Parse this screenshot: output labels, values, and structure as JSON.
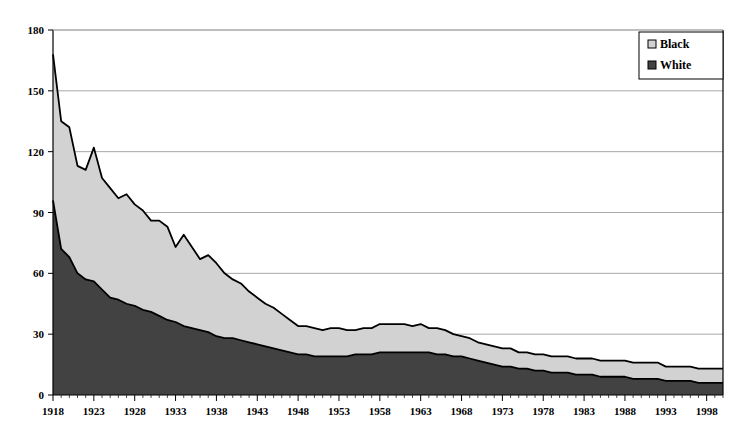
{
  "chart_data": {
    "type": "area",
    "stacked": true,
    "title": "",
    "subtitle": "",
    "xlabel": "",
    "ylabel": "",
    "xlim": [
      1918,
      2000
    ],
    "ylim": [
      0,
      180
    ],
    "yticks": [
      0,
      30,
      60,
      90,
      120,
      150,
      180
    ],
    "xticks": [
      1918,
      1923,
      1928,
      1933,
      1938,
      1943,
      1948,
      1953,
      1958,
      1963,
      1968,
      1973,
      1978,
      1983,
      1988,
      1993,
      1998
    ],
    "grid": "horizontal",
    "legend_position": "top-right",
    "legend": [
      "Black",
      "White"
    ],
    "colors": {
      "black_series": "#d2d2d2",
      "white_series": "#424242",
      "outline": "#000000",
      "grid": "#a8a8a8",
      "axis": "#000000",
      "background": "#ffffff"
    },
    "x": [
      1918,
      1919,
      1920,
      1921,
      1922,
      1923,
      1924,
      1925,
      1926,
      1927,
      1928,
      1929,
      1930,
      1931,
      1932,
      1933,
      1934,
      1935,
      1936,
      1937,
      1938,
      1939,
      1940,
      1941,
      1942,
      1943,
      1944,
      1945,
      1946,
      1947,
      1948,
      1949,
      1950,
      1951,
      1952,
      1953,
      1954,
      1955,
      1956,
      1957,
      1958,
      1959,
      1960,
      1961,
      1962,
      1963,
      1964,
      1965,
      1966,
      1967,
      1968,
      1969,
      1970,
      1971,
      1972,
      1973,
      1974,
      1975,
      1976,
      1977,
      1978,
      1979,
      1980,
      1981,
      1982,
      1983,
      1984,
      1985,
      1986,
      1987,
      1988,
      1989,
      1990,
      1991,
      1992,
      1993,
      1994,
      1995,
      1996,
      1997,
      1998,
      1999,
      2000
    ],
    "series": [
      {
        "name": "White",
        "values": [
          96,
          72,
          68,
          60,
          57,
          56,
          52,
          48,
          47,
          45,
          44,
          42,
          41,
          39,
          37,
          36,
          34,
          33,
          32,
          31,
          29,
          28,
          28,
          27,
          26,
          25,
          24,
          23,
          22,
          21,
          20,
          20,
          19,
          19,
          19,
          19,
          19,
          20,
          20,
          20,
          21,
          21,
          21,
          21,
          21,
          21,
          21,
          20,
          20,
          19,
          19,
          18,
          17,
          16,
          15,
          14,
          14,
          13,
          13,
          12,
          12,
          11,
          11,
          11,
          10,
          10,
          10,
          9,
          9,
          9,
          9,
          8,
          8,
          8,
          8,
          7,
          7,
          7,
          7,
          6,
          6,
          6,
          6
        ]
      },
      {
        "name": "Black",
        "values": [
          72,
          63,
          64,
          53,
          54,
          66,
          55,
          54,
          50,
          54,
          50,
          49,
          45,
          47,
          46,
          37,
          45,
          40,
          35,
          38,
          36,
          32,
          29,
          28,
          25,
          23,
          21,
          20,
          18,
          16,
          14,
          14,
          14,
          13,
          14,
          14,
          13,
          12,
          13,
          13,
          14,
          14,
          14,
          14,
          13,
          14,
          12,
          13,
          12,
          11,
          10,
          10,
          9,
          9,
          9,
          9,
          9,
          8,
          8,
          8,
          8,
          8,
          8,
          8,
          8,
          8,
          8,
          8,
          8,
          8,
          8,
          8,
          8,
          8,
          8,
          7,
          7,
          7,
          7,
          7,
          7,
          7,
          7
        ]
      }
    ],
    "totals": [
      168,
      135,
      132,
      113,
      111,
      122,
      107,
      102,
      97,
      99,
      94,
      91,
      86,
      86,
      83,
      73,
      79,
      73,
      67,
      69,
      65,
      60,
      57,
      55,
      51,
      48,
      45,
      43,
      40,
      37,
      34,
      34,
      33,
      32,
      33,
      33,
      32,
      32,
      33,
      33,
      35,
      35,
      35,
      35,
      34,
      35,
      33,
      33,
      32,
      30,
      29,
      28,
      26,
      25,
      24,
      23,
      23,
      21,
      21,
      20,
      20,
      19,
      19,
      19,
      18,
      18,
      18,
      17,
      17,
      17,
      17,
      16,
      16,
      16,
      16,
      14,
      14,
      14,
      14,
      13,
      13,
      13,
      13
    ]
  }
}
